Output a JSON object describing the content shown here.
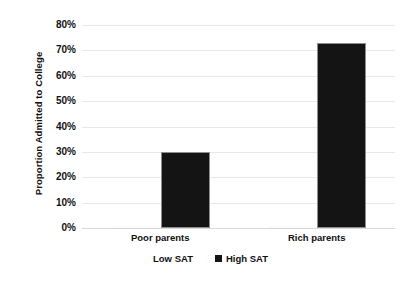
{
  "chart_data": {
    "type": "bar",
    "title": "",
    "subtitle": "",
    "xlabel": "",
    "ylabel": "Proportion Admitted to College",
    "categories": [
      "Poor parents",
      "Rich parents"
    ],
    "series": [
      {
        "name": "Low SAT",
        "color": "#ffffff",
        "values": [
          0,
          0
        ]
      },
      {
        "name": "High SAT",
        "color": "#141414",
        "values": [
          0.3,
          0.73
        ]
      }
    ],
    "ylim": [
      0,
      0.8
    ],
    "ytick_values": [
      0.8,
      0.7,
      0.6,
      0.5,
      0.4,
      0.3,
      0.2,
      0.1,
      0
    ],
    "ytick_labels": [
      "80%",
      "70%",
      "60%",
      "50%",
      "40%",
      "30%",
      "20%",
      "10%",
      "0%"
    ],
    "grid": "horizontal",
    "legend_position": "bottom",
    "annotations": []
  },
  "legend": {
    "items": [
      {
        "label": "Low SAT",
        "swatch": "low-sat-swatch"
      },
      {
        "label": "High SAT",
        "swatch": "high-sat-swatch"
      }
    ]
  }
}
